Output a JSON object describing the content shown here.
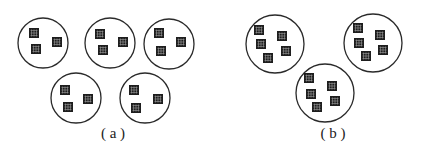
{
  "figure": {
    "panels": [
      {
        "id": "a",
        "label": "( a )",
        "label_pos": [
          113,
          134
        ],
        "groups": [
          {
            "cx": 43,
            "cy": 43,
            "r": 25,
            "squares": [
              [
                34,
                33
              ],
              [
                36,
                49
              ],
              [
                57,
                42
              ]
            ]
          },
          {
            "cx": 110,
            "cy": 43,
            "r": 25,
            "squares": [
              [
                100,
                34
              ],
              [
                103,
                50
              ],
              [
                123,
                42
              ]
            ]
          },
          {
            "cx": 169,
            "cy": 44,
            "r": 25,
            "squares": [
              [
                159,
                33
              ],
              [
                161,
                51
              ],
              [
                181,
                42
              ]
            ]
          },
          {
            "cx": 76,
            "cy": 98,
            "r": 25,
            "squares": [
              [
                65,
                90
              ],
              [
                68,
                107
              ],
              [
                88,
                99
              ]
            ]
          },
          {
            "cx": 145,
            "cy": 98,
            "r": 25,
            "squares": [
              [
                134,
                90
              ],
              [
                136,
                108
              ],
              [
                158,
                99
              ]
            ]
          }
        ]
      },
      {
        "id": "b",
        "label": "( b )",
        "label_pos": [
          333,
          134
        ],
        "groups": [
          {
            "cx": 275,
            "cy": 44,
            "r": 29,
            "squares": [
              [
                259,
                30
              ],
              [
                261,
                44
              ],
              [
                282,
                36
              ],
              [
                286,
                51
              ],
              [
                268,
                58
              ]
            ]
          },
          {
            "cx": 373,
            "cy": 43,
            "r": 29,
            "squares": [
              [
                358,
                28
              ],
              [
                359,
                43
              ],
              [
                380,
                35
              ],
              [
                383,
                50
              ],
              [
                366,
                56
              ]
            ]
          },
          {
            "cx": 325,
            "cy": 93,
            "r": 29,
            "squares": [
              [
                309,
                78
              ],
              [
                311,
                94
              ],
              [
                332,
                86
              ],
              [
                335,
                101
              ],
              [
                317,
                107
              ]
            ]
          }
        ]
      }
    ],
    "square_size": 10,
    "colors": {
      "stroke": "#2a2a2a",
      "square": "#1e1e1e",
      "grid": "#9a9a9a",
      "background": "#ffffff"
    }
  }
}
